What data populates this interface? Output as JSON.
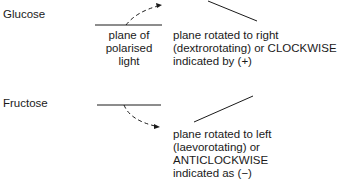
{
  "glucose": {
    "label": "Glucose",
    "plane_label_lines": [
      "plane of",
      "polarised",
      "light"
    ],
    "result_lines": [
      "plane rotated to right",
      "(dextrorotating) or CLOCKWISE",
      "indicated by (+)"
    ]
  },
  "fructose": {
    "label": "Fructose",
    "result_lines": [
      "plane rotated to left",
      "(laevorotating) or",
      "ANTICLOCKWISE",
      "indicated as (−)"
    ]
  },
  "colors": {
    "ink": "#1a1a1a"
  }
}
